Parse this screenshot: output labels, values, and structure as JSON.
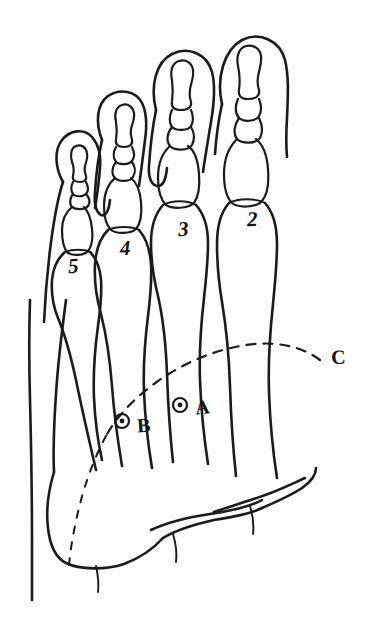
{
  "figure": {
    "style": "hand-drawn pen and ink",
    "background_color": "#fdfdfc",
    "ink_color": "#1b1b1b"
  },
  "labels": {
    "metatarsals": [
      {
        "id": "toe-5",
        "text": "5"
      },
      {
        "id": "toe-4",
        "text": "4"
      },
      {
        "id": "toe-3",
        "text": "3"
      },
      {
        "id": "toe-2",
        "text": "2"
      }
    ],
    "landmarks": [
      {
        "id": "point-a",
        "text": "A"
      },
      {
        "id": "point-b",
        "text": "B"
      }
    ],
    "curves": [
      {
        "id": "curve-c",
        "text": "C"
      }
    ]
  }
}
